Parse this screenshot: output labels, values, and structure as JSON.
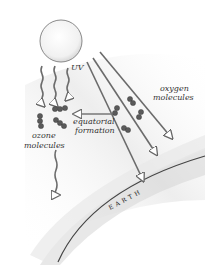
{
  "diagram": {
    "labels": {
      "uv": "UV",
      "oxygen_line1": "oxygen",
      "oxygen_line2": "molecules",
      "equatorial_line1": "equatorial",
      "equatorial_line2": "formation",
      "ozone_line1": "ozone",
      "ozone_line2": "molecules",
      "earth": "EARTH"
    },
    "elements": {
      "sun": "sun",
      "uv_rays_vertical_count": 3,
      "uv_rays_diagonal_count": 3,
      "arrow": "equatorial-formation-arrow"
    },
    "colors": {
      "ray": "#6b6b6b",
      "molecule": "#555555",
      "earth_line": "#444444",
      "atmosphere_shade": "#d9d9d9"
    }
  }
}
